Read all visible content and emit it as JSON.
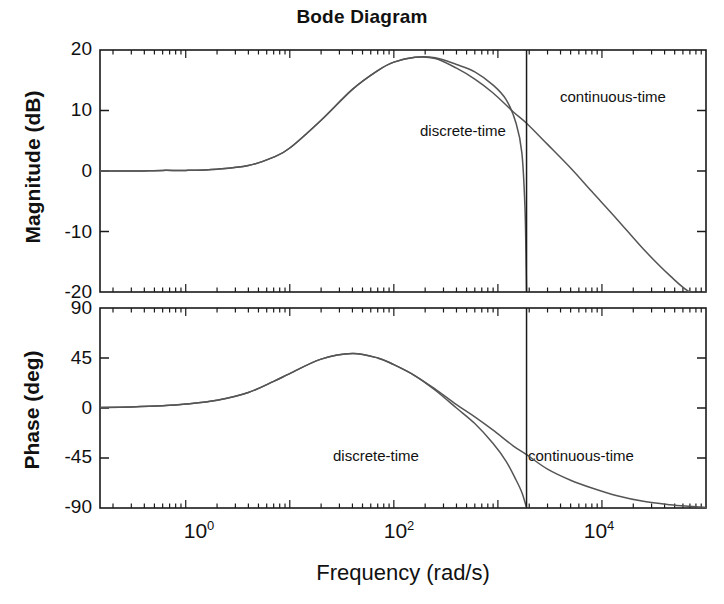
{
  "figure": {
    "title": "Bode Diagram",
    "background": "#ffffff",
    "curve_color": "#555555",
    "axis_color": "#1a1a1a"
  },
  "xaxis": {
    "label": "Frequency  (rad/s)",
    "tick_labels": [
      "10",
      "10",
      "10"
    ],
    "tick_exponents": [
      "0",
      "2",
      "4"
    ],
    "tick_values": [
      1,
      100,
      10000
    ],
    "range": [
      0.15,
      100000
    ],
    "scale": "log"
  },
  "panels": [
    {
      "name": "magnitude",
      "ylabel": "Magnitude (dB)",
      "ticks": [
        "20",
        "10",
        "0",
        "-10",
        "-20"
      ],
      "tick_values": [
        20,
        10,
        0,
        -10,
        -20
      ],
      "ylim": [
        -20,
        20
      ],
      "annotations": [
        {
          "text": "discrete-time",
          "x": 420,
          "y": 130
        },
        {
          "text": "continuous-time",
          "x": 560,
          "y": 95
        }
      ]
    },
    {
      "name": "phase",
      "ylabel": "Phase (deg)",
      "ticks": [
        "90",
        "45",
        "0",
        "-45",
        "-90"
      ],
      "tick_values": [
        90,
        45,
        0,
        -45,
        -90
      ],
      "ylim": [
        -90,
        90
      ],
      "annotations": [
        {
          "text": "discrete-time",
          "x": 335,
          "y": 455
        },
        {
          "text": "continuous-time",
          "x": 530,
          "y": 455
        }
      ]
    }
  ],
  "chart_data": {
    "type": "line",
    "title": "Bode Diagram",
    "xlabel": "Frequency  (rad/s)",
    "xscale": "log",
    "xlim": [
      0.15,
      100000
    ],
    "xticks": [
      1,
      100,
      10000
    ],
    "grid": false,
    "legend": "inline-annotations",
    "nyquist_line": {
      "frequency": 1885,
      "label": "Nyquist frequency"
    },
    "subplots": [
      {
        "ylabel": "Magnitude (dB)",
        "ylim": [
          -20,
          20
        ],
        "yticks": [
          -20,
          -10,
          0,
          10,
          20
        ],
        "series": [
          {
            "name": "continuous-time",
            "x": [
              0.15,
              0.3,
              0.6,
              1,
              2,
              4,
              7,
              10,
              20,
              40,
              70,
              100,
              160,
              250,
              400,
              600,
              900,
              1400,
              1885,
              3000,
              5000,
              8000,
              14000,
              25000,
              45000,
              70000,
              100000
            ],
            "y": [
              0.0,
              0.0,
              0.1,
              0.1,
              0.3,
              0.9,
              2.3,
              3.8,
              8.4,
              13.5,
              16.6,
              18.0,
              18.8,
              18.6,
              17.0,
              15.2,
              12.9,
              9.8,
              7.9,
              4.4,
              0.5,
              -3.4,
              -8.0,
              -12.9,
              -17.3,
              -20.0,
              -20.0
            ]
          },
          {
            "name": "discrete-time",
            "x": [
              0.15,
              0.3,
              0.6,
              1,
              2,
              4,
              7,
              10,
              20,
              40,
              70,
              100,
              160,
              250,
              400,
              600,
              900,
              1200,
              1500,
              1700,
              1820,
              1870,
              1885
            ],
            "y": [
              0.0,
              0.0,
              0.1,
              0.1,
              0.3,
              0.9,
              2.3,
              3.8,
              8.4,
              13.5,
              16.6,
              18.0,
              18.8,
              18.7,
              17.6,
              16.4,
              14.2,
              11.8,
              7.8,
              3.0,
              -6.0,
              -16.0,
              -20.0
            ]
          }
        ]
      },
      {
        "ylabel": "Phase (deg)",
        "ylim": [
          -90,
          90
        ],
        "yticks": [
          -90,
          -45,
          0,
          45,
          90
        ],
        "series": [
          {
            "name": "continuous-time",
            "x": [
              0.15,
              0.3,
              0.6,
              1,
              2,
              4,
              7,
              10,
              20,
              40,
              70,
              100,
              160,
              250,
              400,
              600,
              900,
              1400,
              1885,
              3000,
              5000,
              8000,
              14000,
              25000,
              45000,
              70000,
              100000
            ],
            "y": [
              0.5,
              1.0,
              2.0,
              3.5,
              7.0,
              14.0,
              24.0,
              31.0,
              44.0,
              49.0,
              45.0,
              39.0,
              29.0,
              17.0,
              3.0,
              -8.0,
              -20.0,
              -34.0,
              -42.0,
              -55.0,
              -65.0,
              -72.0,
              -79.0,
              -84.0,
              -87.0,
              -88.5,
              -89.5
            ]
          },
          {
            "name": "discrete-time",
            "x": [
              0.15,
              0.3,
              0.6,
              1,
              2,
              4,
              7,
              10,
              20,
              40,
              70,
              100,
              160,
              250,
              400,
              600,
              900,
              1200,
              1500,
              1700,
              1850,
              1885
            ],
            "y": [
              0.5,
              1.0,
              2.0,
              3.5,
              7.0,
              14.0,
              24.0,
              31.0,
              44.0,
              49.0,
              45.0,
              39.0,
              29.0,
              16.0,
              0.0,
              -14.0,
              -32.0,
              -48.0,
              -65.0,
              -76.0,
              -87.0,
              -90.0
            ]
          }
        ]
      }
    ]
  }
}
